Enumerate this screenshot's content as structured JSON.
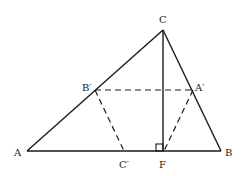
{
  "diagram": {
    "points": {
      "A": {
        "label": "A",
        "x": 27,
        "y": 151
      },
      "B": {
        "label": "B",
        "x": 221,
        "y": 151
      },
      "C": {
        "label": "C",
        "x": 163,
        "y": 30
      },
      "A_prime": {
        "label": "A′",
        "x": 193,
        "y": 90
      },
      "B_prime": {
        "label": "B′",
        "x": 95,
        "y": 90
      },
      "C_prime": {
        "label": "C′",
        "x": 124,
        "y": 151
      },
      "F": {
        "label": "F",
        "x": 163,
        "y": 151
      }
    },
    "solid_segments": [
      [
        "A",
        "B"
      ],
      [
        "B",
        "C"
      ],
      [
        "C",
        "A"
      ],
      [
        "C",
        "F"
      ]
    ],
    "dashed_segments": [
      [
        "B_prime",
        "A_prime"
      ],
      [
        "B_prime",
        "C_prime"
      ],
      [
        "A_prime",
        "F"
      ]
    ],
    "right_angle_marker": {
      "at": "F",
      "size": 7
    }
  }
}
